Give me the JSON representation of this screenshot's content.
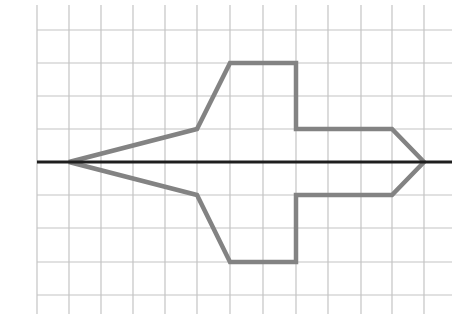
{
  "figure": {
    "colors": {
      "background": "#ffffff",
      "grid": "#c4c4c4",
      "axis": "#1e1e1e",
      "shape_stroke": "#838383"
    },
    "grid": {
      "x_lines": [
        37,
        69,
        101,
        133,
        165,
        197,
        230,
        263,
        296,
        328,
        361,
        392,
        424
      ],
      "y_lines": [
        30,
        63,
        96,
        129,
        195,
        228,
        262,
        295
      ],
      "v_top": 5,
      "v_bottom": 314,
      "h_left": 37,
      "h_right": 452
    },
    "axis": {
      "y": 162,
      "x1": 37,
      "x2": 452
    },
    "shape": {
      "grid_vertices": [
        [
          1,
          0
        ],
        [
          5,
          1
        ],
        [
          6,
          3
        ],
        [
          8,
          3
        ],
        [
          8,
          1
        ],
        [
          11,
          1
        ],
        [
          12,
          0
        ],
        [
          11,
          -1
        ],
        [
          8,
          -1
        ],
        [
          8,
          -3
        ],
        [
          6,
          -3
        ],
        [
          5,
          -1
        ]
      ],
      "points": "69,162 197,129 230,63 296,63 296,129 392,129 424,162 392,195 296,195 296,262 230,262 197,195"
    }
  }
}
